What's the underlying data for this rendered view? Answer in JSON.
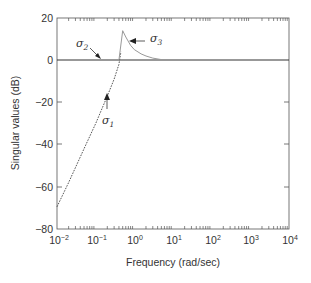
{
  "chart_data": {
    "type": "line",
    "title": "",
    "xlabel": "Frequency (rad/sec)",
    "ylabel": "Singular values (dB)",
    "xscale": "log",
    "xlim": [
      0.01,
      10000
    ],
    "ylim": [
      -80,
      20
    ],
    "grid": false,
    "x_tick_labels": [
      {
        "base": "10",
        "exp": "−2"
      },
      {
        "base": "10",
        "exp": "−1"
      },
      {
        "base": "10",
        "exp": "0"
      },
      {
        "base": "10",
        "exp": "1"
      },
      {
        "base": "10",
        "exp": "2"
      },
      {
        "base": "10",
        "exp": "3"
      },
      {
        "base": "10",
        "exp": "4"
      }
    ],
    "y_tick_labels": [
      "20",
      "0",
      "−20",
      "−40",
      "−60",
      "−80"
    ],
    "series": [
      {
        "name": "σ1",
        "style": "dashed",
        "x": [
          0.01,
          0.02,
          0.05,
          0.1,
          0.2,
          0.3,
          0.4,
          0.45
        ],
        "y": [
          -69.5,
          -58,
          -42,
          -30,
          -17,
          -9,
          -2,
          4
        ]
      },
      {
        "name": "σ2",
        "style": "solid",
        "x": [
          0.01,
          0.1,
          1,
          10,
          100,
          1000,
          10000
        ],
        "y": [
          0,
          0,
          0,
          0,
          0,
          0,
          0
        ]
      },
      {
        "name": "σ3",
        "style": "solid-gray",
        "x": [
          0.4,
          0.5,
          0.6,
          0.8,
          1,
          1.5,
          2,
          3,
          5,
          10
        ],
        "y": [
          0,
          14,
          11,
          7,
          5,
          3,
          2,
          1,
          0.3,
          0
        ]
      }
    ],
    "annotations": [
      {
        "label": "σ2",
        "points_to": "0 dB line near 0.15 rad/sec"
      },
      {
        "label": "σ1",
        "points_to": "dashed curve near 0.3 rad/sec"
      },
      {
        "label": "σ3",
        "points_to": "peak decay near 0.7 rad/sec"
      }
    ]
  },
  "labels": {
    "xlabel": "Frequency (rad/sec)",
    "ylabel": "Singular values (dB)",
    "sigma1": "σ",
    "sigma1_sub": "1",
    "sigma2": "σ",
    "sigma2_sub": "2",
    "sigma3": "σ",
    "sigma3_sub": "3",
    "y20": "20",
    "y0": "0",
    "ym20": "−20",
    "ym40": "−40",
    "ym60": "−60",
    "ym80": "−80",
    "x_base": "10",
    "xe0": "−2",
    "xe1": "−1",
    "xe2": "0",
    "xe3": "1",
    "xe4": "2",
    "xe5": "3",
    "xe6": "4"
  }
}
